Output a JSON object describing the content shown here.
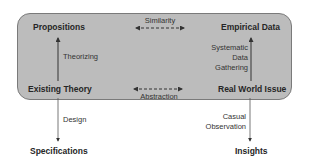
{
  "diagram": {
    "container": {
      "fill": "#bcbcbc",
      "border": "#7a7a7a"
    },
    "nodes": {
      "propositions": "Propositions",
      "empirical_data": "Empirical Data",
      "existing_theory": "Existing Theory",
      "real_world_issue": "Real World Issue",
      "specifications": "Specifications",
      "insights": "Insights"
    },
    "edges": {
      "similarity": "Similarity",
      "abstraction": "Abstraction",
      "theorizing": "Theorizing",
      "systematic_data_gathering": [
        "Systematic",
        "Data",
        "Gathering"
      ],
      "design": "Design",
      "casual_observation": [
        "Casual",
        "Observation"
      ]
    },
    "edge_list": [
      {
        "from": "Existing Theory",
        "to": "Propositions",
        "label": "Theorizing",
        "style": "solid"
      },
      {
        "from": "Real World Issue",
        "to": "Empirical Data",
        "label": "Systematic Data Gathering",
        "style": "solid"
      },
      {
        "from": "Propositions",
        "to": "Empirical Data",
        "label": "Similarity",
        "style": "dashed-bidirectional"
      },
      {
        "from": "Existing Theory",
        "to": "Real World Issue",
        "label": "Abstraction",
        "style": "dashed-bidirectional"
      },
      {
        "from": "Existing Theory",
        "to": "Specifications",
        "label": "Design",
        "style": "solid"
      },
      {
        "from": "Real World Issue",
        "to": "Insights",
        "label": "Casual Observation",
        "style": "solid"
      }
    ]
  }
}
